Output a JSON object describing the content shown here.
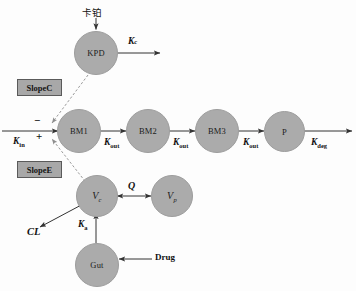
{
  "diagram": {
    "colors": {
      "node_fill": "#ababab",
      "node_stroke": "#9d9d9d",
      "box_fill": "#a8a8a8",
      "box_stroke": "#5a5a5a",
      "arrow": "#333333",
      "dashed_arrow": "#8e8e8e",
      "text": "#111111",
      "background": "#fdfdfd"
    },
    "nodes": [
      {
        "id": "kpd",
        "label": "KPD",
        "italic": false
      },
      {
        "id": "bm1",
        "label": "BM1",
        "italic": false
      },
      {
        "id": "bm2",
        "label": "BM2",
        "italic": false
      },
      {
        "id": "bm3",
        "label": "BM3",
        "italic": false
      },
      {
        "id": "p",
        "label": "P",
        "italic": false
      },
      {
        "id": "vc",
        "label": "V",
        "sub": "c",
        "italic": true
      },
      {
        "id": "vp",
        "label": "V",
        "sub": "p",
        "italic": true
      },
      {
        "id": "gut",
        "label": "Gut",
        "italic": false
      }
    ],
    "boxes": [
      {
        "id": "slopec",
        "label": "SlopeC"
      },
      {
        "id": "slopee",
        "label": "SlopeE"
      }
    ],
    "inputs": {
      "carboplatin": "卡铂",
      "drug": "Drug"
    },
    "rates": {
      "kc": {
        "base": "K",
        "sub": "c",
        "sub_italic": true,
        "display": "Kc"
      },
      "kin": {
        "base": "K",
        "sub": "in",
        "sub_italic": false,
        "display": "Kin"
      },
      "kout1": {
        "base": "K",
        "sub": "out",
        "sub_italic": false,
        "display": "Kout"
      },
      "kout2": {
        "base": "K",
        "sub": "out",
        "sub_italic": false,
        "display": "Kout"
      },
      "kout3": {
        "base": "K",
        "sub": "out",
        "sub_italic": false,
        "display": "Kout"
      },
      "kdeg": {
        "base": "K",
        "sub": "deg",
        "sub_italic": false,
        "display": "Kdeg"
      },
      "ka": {
        "base": "K",
        "sub": "a",
        "sub_italic": false,
        "display": "Ka"
      },
      "q": {
        "base": "Q",
        "sub": "",
        "sub_italic": false,
        "display": "Q"
      },
      "cl": {
        "base": "CL",
        "sub": "",
        "sub_italic": false,
        "display": "CL"
      }
    },
    "signs": {
      "negative": "−",
      "positive": "+"
    }
  }
}
